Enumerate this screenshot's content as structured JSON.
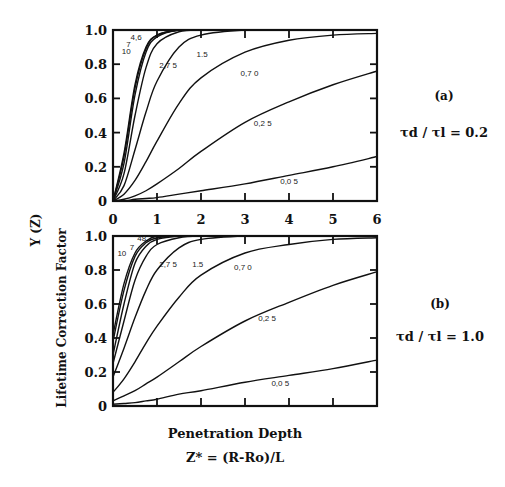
{
  "figure": {
    "y_axis_label": "Lifetime  Correction  Factor",
    "y_symbol": "Y (Z)",
    "x_axis_label": "Penetration Depth",
    "x_formula": "Z* = (R-Ro)/L",
    "panel_a": {
      "tag": "(a)",
      "ratio_label": "τd / τl = 0.2"
    },
    "panel_b": {
      "tag": "(b)",
      "ratio_label": "τd / τl = 1.0"
    }
  },
  "chart_data": [
    {
      "type": "line",
      "title": "(a) τd/τl = 0.2",
      "xlabel": "Penetration Depth  Z* = (R-Ro)/L",
      "ylabel": "Lifetime Correction Factor Y(Z)",
      "xlim": [
        0,
        6
      ],
      "ylim": [
        0,
        1.0
      ],
      "xticks": [
        0,
        1,
        2,
        3,
        4,
        5,
        6
      ],
      "yticks": [
        0,
        0.2,
        0.4,
        0.6,
        0.8,
        1.0
      ],
      "grid": false,
      "legend": "inline curve labels",
      "x": [
        0,
        0.25,
        0.5,
        0.75,
        1,
        1.5,
        2,
        3,
        4,
        5,
        6
      ],
      "series": [
        {
          "name": "10",
          "values": [
            0,
            0.28,
            0.68,
            0.9,
            0.97,
            1.0,
            1.0,
            1.0,
            1.0,
            1.0,
            1.0
          ]
        },
        {
          "name": "7",
          "values": [
            0,
            0.26,
            0.66,
            0.89,
            0.97,
            1.0,
            1.0,
            1.0,
            1.0,
            1.0,
            1.0
          ]
        },
        {
          "name": "4.6",
          "values": [
            0,
            0.22,
            0.62,
            0.87,
            0.96,
            1.0,
            1.0,
            1.0,
            1.0,
            1.0,
            1.0
          ]
        },
        {
          "name": "2.75",
          "values": [
            0,
            0.16,
            0.5,
            0.78,
            0.92,
            0.99,
            1.0,
            1.0,
            1.0,
            1.0,
            1.0
          ]
        },
        {
          "name": "1.5",
          "values": [
            0,
            0.09,
            0.3,
            0.52,
            0.7,
            0.9,
            0.97,
            1.0,
            1.0,
            1.0,
            1.0
          ]
        },
        {
          "name": "0.70",
          "values": [
            0,
            0.04,
            0.12,
            0.23,
            0.35,
            0.57,
            0.72,
            0.87,
            0.94,
            0.97,
            0.98
          ]
        },
        {
          "name": "0.25",
          "values": [
            0,
            0.01,
            0.03,
            0.06,
            0.1,
            0.19,
            0.29,
            0.46,
            0.58,
            0.68,
            0.76
          ]
        },
        {
          "name": "0.05",
          "values": [
            0,
            0.0,
            0.01,
            0.015,
            0.02,
            0.04,
            0.06,
            0.1,
            0.15,
            0.2,
            0.26
          ]
        }
      ]
    },
    {
      "type": "line",
      "title": "(b) τd/τl = 1.0",
      "xlabel": "Penetration Depth  Z* = (R-Ro)/L",
      "ylabel": "Lifetime Correction Factor Y(Z)",
      "xlim": [
        0,
        6
      ],
      "ylim": [
        0,
        1.0
      ],
      "xticks": [
        0,
        1,
        2,
        3,
        4,
        5,
        6
      ],
      "yticks": [
        0,
        0.2,
        0.4,
        0.6,
        0.8,
        1.0
      ],
      "grid": false,
      "legend": "inline curve labels",
      "x": [
        0,
        0.25,
        0.5,
        0.75,
        1,
        1.5,
        2,
        3,
        4,
        5,
        6
      ],
      "series": [
        {
          "name": "10",
          "values": [
            0.42,
            0.72,
            0.9,
            0.97,
            1.0,
            1.0,
            1.0,
            1.0,
            1.0,
            1.0,
            1.0
          ]
        },
        {
          "name": "7",
          "values": [
            0.38,
            0.68,
            0.88,
            0.96,
            0.99,
            1.0,
            1.0,
            1.0,
            1.0,
            1.0,
            1.0
          ]
        },
        {
          "name": "4.6",
          "values": [
            0.3,
            0.6,
            0.84,
            0.94,
            0.98,
            1.0,
            1.0,
            1.0,
            1.0,
            1.0,
            1.0
          ]
        },
        {
          "name": "2.75",
          "values": [
            0.25,
            0.5,
            0.74,
            0.88,
            0.95,
            0.99,
            1.0,
            1.0,
            1.0,
            1.0,
            1.0
          ]
        },
        {
          "name": "1.5",
          "values": [
            0.17,
            0.34,
            0.52,
            0.68,
            0.8,
            0.93,
            0.98,
            1.0,
            1.0,
            1.0,
            1.0
          ]
        },
        {
          "name": "0.70",
          "values": [
            0.08,
            0.16,
            0.26,
            0.37,
            0.47,
            0.64,
            0.77,
            0.9,
            0.95,
            0.98,
            0.99
          ]
        },
        {
          "name": "0.25",
          "values": [
            0.03,
            0.06,
            0.09,
            0.13,
            0.17,
            0.26,
            0.35,
            0.5,
            0.61,
            0.71,
            0.79
          ]
        },
        {
          "name": "0.05",
          "values": [
            0.01,
            0.015,
            0.02,
            0.03,
            0.04,
            0.07,
            0.09,
            0.14,
            0.18,
            0.22,
            0.27
          ]
        }
      ]
    }
  ]
}
